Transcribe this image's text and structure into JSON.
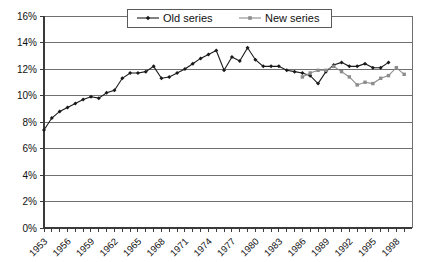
{
  "chart_data": {
    "type": "line",
    "title": "",
    "subtitle": "",
    "xlabel": "",
    "ylabel": "",
    "ylim": [
      0,
      16
    ],
    "ytick_labels": [
      "0%",
      "2%",
      "4%",
      "6%",
      "8%",
      "10%",
      "12%",
      "14%",
      "16%"
    ],
    "ytick_values": [
      0,
      2,
      4,
      6,
      8,
      10,
      12,
      14,
      16
    ],
    "xlim": [
      1953,
      2000
    ],
    "xtick_labels": [
      "1953",
      "1956",
      "1959",
      "1962",
      "1965",
      "1968",
      "1971",
      "1974",
      "1977",
      "1980",
      "1983",
      "1986",
      "1989",
      "1992",
      "1995",
      "1998"
    ],
    "xtick_values": [
      1953,
      1956,
      1959,
      1962,
      1965,
      1968,
      1971,
      1974,
      1977,
      1980,
      1983,
      1986,
      1989,
      1992,
      1995,
      1998
    ],
    "grid": true,
    "legend_position": "top-center",
    "value_unit": "percent",
    "series": [
      {
        "name": "Old series",
        "color": "#1a1a1a",
        "marker": "diamond",
        "x": [
          1953,
          1954,
          1955,
          1956,
          1957,
          1958,
          1959,
          1960,
          1961,
          1962,
          1963,
          1964,
          1965,
          1966,
          1967,
          1968,
          1969,
          1970,
          1971,
          1972,
          1973,
          1974,
          1975,
          1976,
          1977,
          1978,
          1979,
          1980,
          1981,
          1982,
          1983,
          1984,
          1985,
          1986,
          1987,
          1988,
          1989,
          1990,
          1991,
          1992,
          1993,
          1994,
          1995,
          1996,
          1997
        ],
        "values": [
          7.4,
          8.3,
          8.8,
          9.1,
          9.4,
          9.7,
          9.9,
          9.8,
          10.2,
          10.4,
          11.3,
          11.7,
          11.7,
          11.8,
          12.2,
          11.3,
          11.4,
          11.7,
          12.0,
          12.4,
          12.8,
          13.1,
          13.4,
          11.9,
          12.9,
          12.6,
          13.6,
          12.7,
          12.2,
          12.2,
          12.2,
          11.9,
          11.8,
          11.7,
          11.5,
          10.9,
          11.8,
          12.3,
          12.5,
          12.2,
          12.2,
          12.4,
          12.1,
          12.1,
          12.5
        ]
      },
      {
        "name": "New series",
        "color": "#8c8c8c",
        "marker": "square",
        "x": [
          1986,
          1987,
          1988,
          1989,
          1990,
          1991,
          1992,
          1993,
          1994,
          1995,
          1996,
          1997,
          1998,
          1999
        ],
        "values": [
          11.4,
          11.7,
          11.9,
          11.9,
          12.2,
          11.8,
          11.4,
          10.8,
          11.0,
          10.9,
          11.3,
          11.5,
          12.1,
          11.6
        ]
      }
    ]
  },
  "legend": {
    "items": [
      {
        "label": "Old series"
      },
      {
        "label": "New series"
      }
    ]
  }
}
